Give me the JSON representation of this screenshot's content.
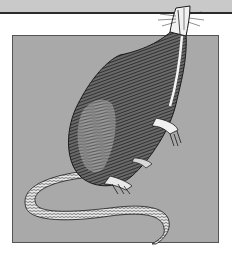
{
  "image": {
    "subject": "rat engraving illustration",
    "description": "Black-and-white cross-hatched drawing of a rat rearing up on its hind legs, snout breaking out of the top edge of a gray square frame, long scaly tail curling in the foreground",
    "colors": {
      "top_band": "#c9c9c9",
      "top_rule": "#2b2b2b",
      "frame_fill": "#a9a9a9",
      "frame_border": "#555555",
      "ink": "#1a1a1a",
      "highlight": "#f4f4f4",
      "page_background": "#ffffff"
    }
  }
}
